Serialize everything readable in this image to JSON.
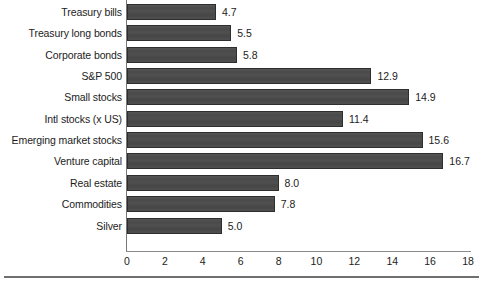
{
  "chart_data": {
    "type": "bar",
    "orientation": "horizontal",
    "title": "",
    "subtitle": "",
    "xlabel": "",
    "ylabel": "",
    "xlim": [
      0,
      18
    ],
    "xticks": [
      0,
      2,
      4,
      6,
      8,
      10,
      12,
      14,
      16,
      18
    ],
    "xtick_labels": [
      "0",
      "2",
      "4",
      "6",
      "8",
      "10",
      "12",
      "14",
      "16",
      "18"
    ],
    "grid": false,
    "legend": false,
    "bar_color": "#4c4c4c",
    "background_color": "#ffffff",
    "text_color": "#1c1c1c",
    "categories": [
      "Treasury bills",
      "Treasury long bonds",
      "Corporate bonds",
      "S&P 500",
      "Small stocks",
      "Intl stocks (x US)",
      "Emerging market stocks",
      "Venture capital",
      "Real estate",
      "Commodities",
      "Silver"
    ],
    "values": [
      4.7,
      5.5,
      5.8,
      12.9,
      14.9,
      11.4,
      15.6,
      16.7,
      8.0,
      7.8,
      5.0
    ],
    "value_labels": [
      "4.7",
      "5.5",
      "5.8",
      "12.9",
      "14.9",
      "11.4",
      "15.6",
      "16.7",
      "8.0",
      "7.8",
      "5.0"
    ]
  }
}
